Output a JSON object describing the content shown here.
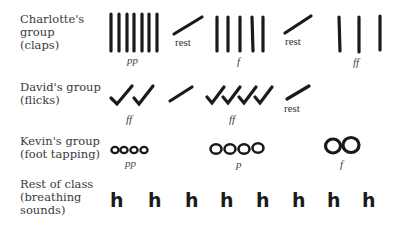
{
  "rows": [
    {
      "label": "Charlotte's\ngroup\n(claps)",
      "symbol": "clap",
      "segments": [
        {
          "type": "notes",
          "count": 7,
          "dynamic": "pp"
        },
        {
          "type": "rest",
          "label": "rest"
        },
        {
          "type": "notes",
          "count": 5,
          "dynamic": "f"
        },
        {
          "type": "rest",
          "label": "rest"
        },
        {
          "type": "notes",
          "count": 3,
          "dynamic": "ff"
        }
      ]
    },
    {
      "label": "David's group\n(flicks)",
      "symbol": "flick",
      "segments": [
        {
          "type": "notes",
          "count": 2,
          "dynamic": "ff"
        },
        {
          "type": "rest",
          "label": ""
        },
        {
          "type": "notes",
          "count": 4,
          "dynamic": "ff"
        },
        {
          "type": "rest",
          "label": "rest"
        }
      ]
    },
    {
      "label": "Kevin's group\n(foot tapping)",
      "symbol": "tap",
      "segments": [
        {
          "type": "notes",
          "count": 4,
          "dynamic": "pp",
          "size": "small"
        },
        {
          "type": "notes",
          "count": 4,
          "dynamic": "p",
          "size": "medium"
        },
        {
          "type": "notes",
          "count": 2,
          "dynamic": "f",
          "size": "large"
        }
      ]
    },
    {
      "label": "Rest of class\n(breathing\nsounds)",
      "symbol": "h",
      "segments": [
        {
          "type": "notes",
          "count": 8,
          "dynamic": ""
        }
      ]
    }
  ],
  "text": {
    "row1_label": "Charlotte's\ngroup\n(claps)",
    "row2_label": "David's group\n(flicks)",
    "row3_label": "Kevin's group\n(foot tapping)",
    "row4_label": "Rest of class\n(breathing\nsounds)",
    "rest": "rest",
    "pp": "pp",
    "p": "p",
    "f": "f",
    "ff": "ff",
    "h": "h"
  }
}
